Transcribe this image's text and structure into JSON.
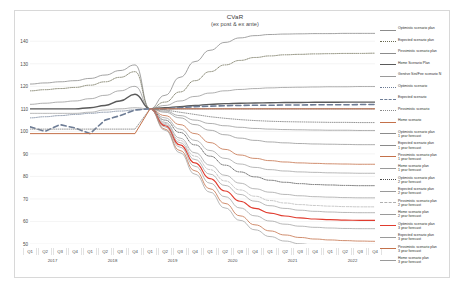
{
  "chart_data": {
    "type": "line",
    "title": "CVaR",
    "subtitle": "(ex post & ex ante)",
    "xlabel": "",
    "ylabel": "",
    "ylim": [
      50,
      145
    ],
    "yticks": [
      140,
      130,
      120,
      110,
      100,
      90,
      80,
      70,
      60,
      50
    ],
    "grid": true,
    "legend_position": "right",
    "x": [
      "Q1 2017",
      "Q2 2017",
      "Q3 2017",
      "Q4 2017",
      "Q1 2018",
      "Q2 2018",
      "Q3 2018",
      "Q4 2018",
      "Q1 2019",
      "Q2 2019",
      "Q3 2019",
      "Q4 2019",
      "Q1 2020",
      "Q2 2020",
      "Q3 2020",
      "Q4 2020",
      "Q1 2021",
      "Q2 2021",
      "Q3 2021",
      "Q4 2021",
      "Q1 2022",
      "Q2 2022",
      "Q3 2022",
      "Q4 2022"
    ],
    "quarter_ticks": [
      "Q1",
      "Q2",
      "Q3",
      "Q4",
      "Q1",
      "Q2",
      "Q3",
      "Q4",
      "Q1",
      "Q2",
      "Q3",
      "Q4",
      "Q1",
      "Q2",
      "Q3",
      "Q4",
      "Q1",
      "Q2",
      "Q3",
      "Q4",
      "Q1",
      "Q2",
      "Q3",
      "Q4"
    ],
    "year_labels": [
      "2017",
      "2018",
      "2019",
      "2020",
      "2021",
      "2022"
    ],
    "series": [
      {
        "name": "Optimistic scenario plan",
        "color": "#8c8c8c",
        "style": "solid",
        "width": 0.8,
        "values": [
          121,
          121.5,
          122,
          122.5,
          123.5,
          125,
          127,
          129.5,
          110,
          116,
          124,
          131,
          136,
          139.5,
          141.5,
          142.5,
          143,
          143.2,
          143.3,
          143.4,
          143.4,
          143.5,
          143.5,
          143.5
        ]
      },
      {
        "name": "Expected scenario plan",
        "color": "#6b6b52",
        "style": "dotted",
        "width": 0.8,
        "values": [
          118,
          118.5,
          119,
          119.5,
          120.5,
          122,
          124,
          126.5,
          110,
          113,
          117.5,
          122.5,
          126.5,
          129.5,
          131.5,
          132.8,
          133.5,
          134,
          134.2,
          134.4,
          134.5,
          134.6,
          134.6,
          134.7
        ]
      },
      {
        "name": "Pessimistic scenario plan",
        "color": "#8c8c8c",
        "style": "solid",
        "width": 0.7,
        "values": [
          112,
          112.5,
          113,
          113.5,
          114.5,
          116,
          118,
          120,
          110,
          111.5,
          113.5,
          115.5,
          117,
          118,
          118.6,
          119,
          119.3,
          119.5,
          119.6,
          119.7,
          119.8,
          119.8,
          119.9,
          119.9
        ]
      },
      {
        "name": "Home Scenario Plan",
        "color": "#5a5a5a",
        "style": "solid",
        "width": 1.4,
        "values": [
          110,
          110,
          110,
          110,
          110.5,
          111.5,
          113.5,
          116.5,
          110,
          110.5,
          111,
          111.5,
          112,
          112.3,
          112.5,
          112.6,
          112.7,
          112.8,
          112.8,
          112.9,
          112.9,
          113,
          113,
          113
        ]
      },
      {
        "name": "Genève Sini/Fee scenario N",
        "color": "#9a9a9a",
        "style": "solid",
        "width": 0.7,
        "values": [
          108,
          108,
          108,
          108,
          108.5,
          109.5,
          110,
          110.5,
          110,
          110,
          110,
          110,
          110,
          110,
          110,
          110,
          110,
          110,
          110,
          110,
          110,
          110,
          110,
          110
        ]
      },
      {
        "name": "Optimistic scenario",
        "color": "#6e7d96",
        "style": "dotted",
        "width": 0.8,
        "values": [
          106,
          106.5,
          107,
          107.5,
          108,
          108.5,
          109,
          109.5,
          110,
          110,
          110,
          110,
          110,
          110,
          110,
          110,
          110,
          110,
          110,
          110,
          110,
          110,
          110,
          110
        ]
      },
      {
        "name": "Expected scenario",
        "color": "#6e7d96",
        "style": "dashed",
        "width": 1.6,
        "values": [
          102,
          100,
          103,
          101.5,
          99,
          105,
          107,
          109.5,
          110,
          110,
          110.5,
          111,
          111.2,
          111.4,
          111.5,
          111.6,
          111.6,
          111.7,
          111.7,
          111.8,
          111.8,
          111.8,
          111.9,
          111.9
        ]
      },
      {
        "name": "Pessimistic scenario",
        "color": "#8a8a8a",
        "style": "dotted",
        "width": 0.9,
        "values": [
          101,
          101,
          101,
          101,
          101,
          101,
          101,
          101,
          110,
          109.5,
          108.5,
          107.5,
          106.5,
          105.8,
          105.2,
          104.8,
          104.5,
          104.3,
          104.2,
          104.1,
          104,
          104,
          103.9,
          103.9
        ]
      },
      {
        "name": "Home scenario",
        "color": "#c4714a",
        "style": "solid",
        "width": 1.0,
        "values": [
          99,
          99,
          99,
          99,
          99,
          99,
          99,
          99,
          110,
          110,
          110,
          110,
          110,
          110,
          110,
          110,
          110,
          110,
          110,
          110,
          110,
          110,
          110,
          110
        ]
      },
      {
        "name": "Optimistic scenario plan",
        "sub": "1 year forecast",
        "color": "#8c8c8c",
        "style": "solid",
        "width": 0.7,
        "values": [
          null,
          null,
          null,
          null,
          null,
          null,
          null,
          null,
          110,
          109,
          107,
          105,
          103.5,
          102.5,
          101.8,
          101.3,
          101,
          100.8,
          100.7,
          100.6,
          100.5,
          100.5,
          100.4,
          100.4
        ]
      },
      {
        "name": "Expected scenario plan",
        "sub": "1 year forecast",
        "color": "#8a8a8a",
        "style": "solid",
        "width": 0.7,
        "values": [
          null,
          null,
          null,
          null,
          null,
          null,
          null,
          null,
          110,
          108.5,
          106,
          103,
          100.5,
          98.5,
          97,
          96,
          95.3,
          94.9,
          94.6,
          94.4,
          94.3,
          94.2,
          94.1,
          94.1
        ]
      },
      {
        "name": "Pessimistic scenario plan",
        "sub": "1 year forecast",
        "color": "#c4714a",
        "style": "solid",
        "width": 0.8,
        "values": [
          null,
          null,
          null,
          null,
          null,
          null,
          null,
          null,
          110,
          107,
          103,
          99,
          95,
          92,
          89.5,
          88,
          87,
          86.4,
          86,
          85.8,
          85.6,
          85.5,
          85.4,
          85.4
        ]
      },
      {
        "name": "Home scenario plan",
        "sub": "1 year forecast",
        "color": "#9a9a9a",
        "style": "solid",
        "width": 0.7,
        "values": [
          null,
          null,
          null,
          null,
          null,
          null,
          null,
          null,
          110,
          106,
          101,
          96,
          91.5,
          88,
          85.5,
          84,
          83,
          82.4,
          82,
          81.8,
          81.6,
          81.5,
          81.4,
          81.4
        ]
      },
      {
        "name": "Optimistic scenario plan",
        "sub": "2 year forecast",
        "color": "#4a4a4a",
        "style": "dotted",
        "width": 0.8,
        "values": [
          null,
          null,
          null,
          null,
          null,
          null,
          null,
          null,
          110,
          105,
          99.5,
          94,
          89,
          85,
          82,
          79.8,
          78.3,
          77.4,
          76.8,
          76.4,
          76.2,
          76,
          75.9,
          75.9
        ]
      },
      {
        "name": "Expected scenario plan",
        "sub": "2 year forecast",
        "color": "#9a9a9a",
        "style": "solid",
        "width": 0.7,
        "values": [
          null,
          null,
          null,
          null,
          null,
          null,
          null,
          null,
          110,
          104,
          97,
          90.5,
          85,
          80.5,
          77,
          74.5,
          73,
          72,
          71.4,
          71,
          70.8,
          70.6,
          70.5,
          70.5
        ]
      },
      {
        "name": "Pessimistic scenario plan",
        "sub": "2 year forecast",
        "color": "#b0b0b0",
        "style": "dashed",
        "width": 0.7,
        "values": [
          null,
          null,
          null,
          null,
          null,
          null,
          null,
          null,
          110,
          103.5,
          96,
          89,
          83,
          78,
          74,
          71.2,
          69.3,
          68.2,
          67.5,
          67.1,
          66.8,
          66.6,
          66.5,
          66.5
        ]
      },
      {
        "name": "Home scenario plan",
        "sub": "2 year forecast",
        "color": "#9a9a9a",
        "style": "solid",
        "width": 0.7,
        "values": [
          null,
          null,
          null,
          null,
          null,
          null,
          null,
          null,
          110,
          103,
          95,
          87.5,
          81,
          76,
          72,
          69,
          67,
          65.8,
          65,
          64.5,
          64.2,
          64,
          63.9,
          63.9
        ]
      },
      {
        "name": "Optimistic scenario plan",
        "sub": "3 year forecast",
        "color": "#e03b2e",
        "style": "solid",
        "width": 1.1,
        "values": [
          null,
          null,
          null,
          null,
          null,
          null,
          null,
          null,
          110,
          102.5,
          94,
          86,
          79,
          73.5,
          69,
          65.8,
          63.7,
          62.4,
          61.6,
          61.1,
          60.8,
          60.6,
          60.5,
          60.5
        ]
      },
      {
        "name": "Expected scenario plan",
        "sub": "3 year forecast",
        "color": "#9a9a9a",
        "style": "solid",
        "width": 0.7,
        "values": [
          null,
          null,
          null,
          null,
          null,
          null,
          null,
          null,
          110,
          102,
          93,
          84.5,
          77,
          71,
          66,
          62.5,
          60.2,
          58.8,
          57.9,
          57.4,
          57.1,
          56.9,
          56.8,
          56.8
        ]
      },
      {
        "name": "Pessimistic scenario plan",
        "sub": "3 year forecast",
        "color": "#c4714a",
        "style": "solid",
        "width": 0.8,
        "values": [
          null,
          null,
          null,
          null,
          null,
          null,
          null,
          null,
          110,
          101,
          91.5,
          82.5,
          74.5,
          68,
          62.5,
          58.5,
          55.8,
          54,
          52.9,
          52.2,
          51.8,
          51.5,
          51.3,
          51.2
        ]
      },
      {
        "name": "Home scenario plan",
        "sub": "3 year forecast",
        "color": "#9a9a9a",
        "style": "solid",
        "width": 0.7,
        "values": [
          null,
          null,
          null,
          null,
          null,
          null,
          null,
          null,
          110,
          100.5,
          90.5,
          81,
          73,
          66,
          60.5,
          56.3,
          53.3,
          51.3,
          50.1,
          49.4,
          48.9,
          48.6,
          48.4,
          48.3
        ]
      }
    ]
  }
}
